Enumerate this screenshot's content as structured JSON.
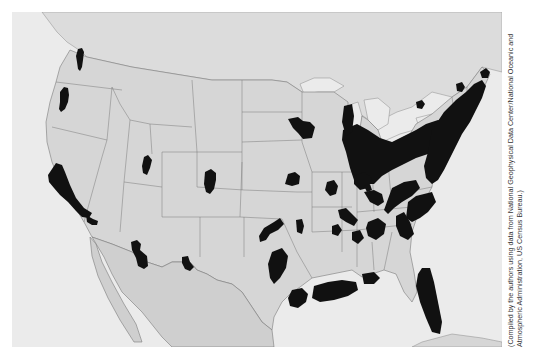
{
  "figure": {
    "type": "map",
    "region": "Contiguous United States with parts of Canada and Mexico",
    "style": "grayscale shaded relief, black shaded regions",
    "colors": {
      "water": "#ebebeb",
      "canada": "#dcdcdc",
      "us_land": "#d6d6d6",
      "mexico": "#cfcfcf",
      "borders": "#7a7a7a",
      "highlight": "#111111"
    }
  },
  "caption": {
    "text": "(Compiled by the authors using data from National Geophysical Data Center/National Oceanic and Atmospheric Administration, US Census Bureau.)"
  },
  "highlight_regions": [
    {
      "name": "puget-sound",
      "points": "198,108 208,102 214,108 212,130 210,148 206,162 200,158 198,140 196,122"
    },
    {
      "name": "willamette-valley",
      "points": "150,240 160,224 170,228 172,248 168,268 160,290 150,300 144,292 146,268"
    },
    {
      "name": "california-bay-central",
      "points": "108,490 132,452 152,458 160,480 176,520 196,560 220,590 246,604 236,620 214,616 192,596 170,572 146,550 128,528 112,512"
    },
    {
      "name": "southern-california",
      "points": "224,610 244,622 260,628 258,640 242,640 226,630"
    },
    {
      "name": "salt-lake-area",
      "points": "396,436 410,428 420,444 414,468 406,490 396,484 392,462"
    },
    {
      "name": "colorado-front-range",
      "points": "580,480 598,472 612,484 614,506 606,530 596,548 584,540 578,516"
    },
    {
      "name": "phoenix-area",
      "points": "358,150 376,144 388,156 386,176 406,194 410,226 396,236 380,226 372,198 360,174"
    },
    {
      "name": "albuquerque-area",
      "points": "512,196 528,194 536,212 548,228 534,240 520,234 512,214"
    },
    {
      "name": "minneapolis-area",
      "points": "438,20 468,14 484,26 506,28 522,44 510,78 484,82 468,62 452,48"
    },
    {
      "name": "great-lakes-urban-belt",
      "points": "480,300 530,280 580,300 620,330 650,360 680,380 720,380 760,360 800,340 850,330 880,340 900,380 880,420 860,440 820,440 780,420 740,420 700,440 660,440 620,420 580,420 540,410 510,390"
    },
    {
      "name": "northeast-corridor",
      "points": "860,380 900,320 940,280 980,250 1020,220 1060,180 1080,160 1090,180 1080,220 1060,260 1040,300 1020,340 1000,380 980,420 960,460 930,480 900,460 880,420"
    },
    {
      "name": "ottawa-area",
      "points": "830,230 850,222 860,234 852,248 836,246"
    },
    {
      "name": "montreal-area",
      "points": "1000,180 1016,172 1026,186 1020,204 1006,204"
    }
  ],
  "labels": {
    "note": "No visible legend, title, or place-name labels on the map face"
  }
}
